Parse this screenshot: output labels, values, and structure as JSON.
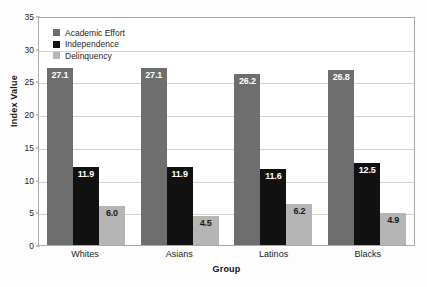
{
  "chart_data": {
    "type": "bar",
    "title": "",
    "xlabel": "Group",
    "ylabel": "Index Value",
    "categories": [
      "Whites",
      "Asians",
      "Latinos",
      "Blacks"
    ],
    "series": [
      {
        "name": "Academic Effort",
        "color": "#6e6e6e",
        "label_color": "#ffffff",
        "values": [
          27.1,
          27.1,
          26.2,
          26.8
        ],
        "labels": [
          "27.1",
          "27.1",
          "26.2",
          "26.8"
        ]
      },
      {
        "name": "Independence",
        "color": "#111111",
        "label_color": "#ffffff",
        "values": [
          11.9,
          11.9,
          11.6,
          12.5
        ],
        "labels": [
          "11.9",
          "11.9",
          "11.6",
          "12.5"
        ]
      },
      {
        "name": "Delinquency",
        "color": "#b5b5b5",
        "label_color": "#1a1a1a",
        "values": [
          6.0,
          4.5,
          6.2,
          4.9
        ],
        "labels": [
          "6.0",
          "4.5",
          "6.2",
          "4.9"
        ]
      }
    ],
    "ylim": [
      0,
      35
    ],
    "yticks": [
      0,
      5,
      10,
      15,
      20,
      25,
      30,
      35
    ],
    "ytick_labels": [
      "0",
      "5",
      "10",
      "15",
      "20",
      "25",
      "30",
      "35"
    ],
    "grid": true,
    "legend_position": "top-left"
  }
}
